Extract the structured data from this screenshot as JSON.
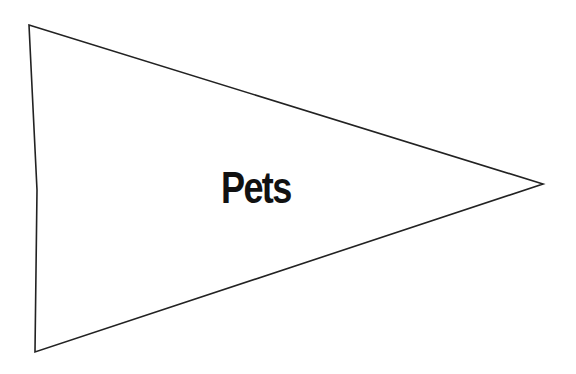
{
  "pennant": {
    "label": "Pets",
    "stroke_color": "#222222",
    "fill_color": "#ffffff",
    "text_color": "#111111",
    "vertices": {
      "top_left": [
        29,
        25
      ],
      "tip": [
        543,
        184
      ],
      "bottom_left": [
        35,
        352
      ],
      "left_edge_mid": [
        37,
        190
      ]
    }
  }
}
